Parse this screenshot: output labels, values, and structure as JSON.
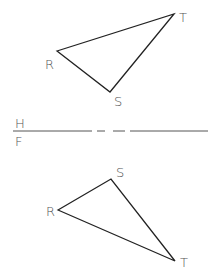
{
  "diagram": {
    "top_view": {
      "vertices": {
        "R": {
          "label": "R",
          "x": 57,
          "y": 51
        },
        "S": {
          "label": "S",
          "x": 110,
          "y": 92
        },
        "T": {
          "label": "T",
          "x": 174,
          "y": 14
        }
      }
    },
    "folding_line": {
      "upper_label": "H",
      "lower_label": "F"
    },
    "front_view": {
      "vertices": {
        "R": {
          "label": "R",
          "x": 58,
          "y": 210
        },
        "S": {
          "label": "S",
          "x": 111,
          "y": 179
        },
        "T": {
          "label": "T",
          "x": 175,
          "y": 261
        }
      }
    },
    "colors": {
      "line": "#222222",
      "label": "#555555",
      "background": "#ffffff"
    }
  }
}
